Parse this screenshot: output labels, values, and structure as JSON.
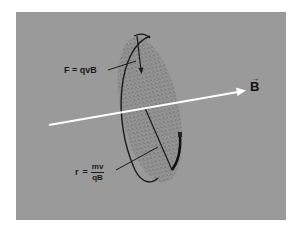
{
  "figure": {
    "background_color": "#ffffff",
    "panel_color": "#9a9a9a",
    "disk_fill": "#8e8e8e",
    "stroke_color": "#1a1a1a",
    "field_arrow_color": "#ffffff"
  },
  "labels": {
    "force": {
      "lhs": "F",
      "eq": "=",
      "rhs": "qvB",
      "full": "F = qvB"
    },
    "radius": {
      "lhs": "r",
      "eq": "=",
      "numerator": "mv",
      "denominator": "qB"
    },
    "field": {
      "symbol": "B",
      "vector_mark": "→"
    }
  }
}
